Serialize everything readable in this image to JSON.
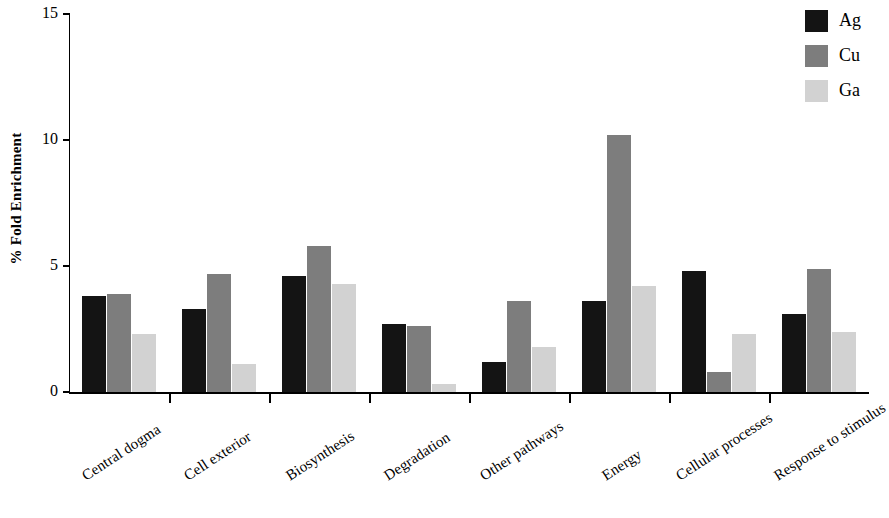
{
  "chart_data": {
    "type": "bar",
    "title": "",
    "subtitle": "",
    "xlabel": "",
    "ylabel": "% Fold Enrichment",
    "ylim": [
      0,
      15
    ],
    "yticks": [
      0,
      5,
      10,
      15
    ],
    "ytick_labels": [
      "0",
      "5",
      "10",
      "15"
    ],
    "grid": false,
    "legend_position": "top-right",
    "categories": [
      "Central dogma",
      "Cell exterior",
      "Biosynthesis",
      "Degradation",
      "Other pathways",
      "Energy",
      "Cellular processes",
      "Response to stimulus"
    ],
    "series": [
      {
        "name": "Ag",
        "color": "#141414",
        "values": [
          3.8,
          3.3,
          4.6,
          2.7,
          1.2,
          3.6,
          4.8,
          3.1
        ]
      },
      {
        "name": "Cu",
        "color": "#7d7d7d",
        "values": [
          3.9,
          4.7,
          5.8,
          2.6,
          3.6,
          10.2,
          0.8,
          4.9
        ]
      },
      {
        "name": "Ga",
        "color": "#d2d2d2",
        "values": [
          2.3,
          1.1,
          4.3,
          0.3,
          1.8,
          4.2,
          2.3,
          2.4
        ]
      }
    ]
  },
  "legend": {
    "entries": [
      {
        "label": "Ag",
        "color": "#141414"
      },
      {
        "label": "Cu",
        "color": "#7d7d7d"
      },
      {
        "label": "Ga",
        "color": "#d2d2d2"
      }
    ]
  },
  "axes": {
    "y_axis_title": "% Fold Enrichment"
  }
}
